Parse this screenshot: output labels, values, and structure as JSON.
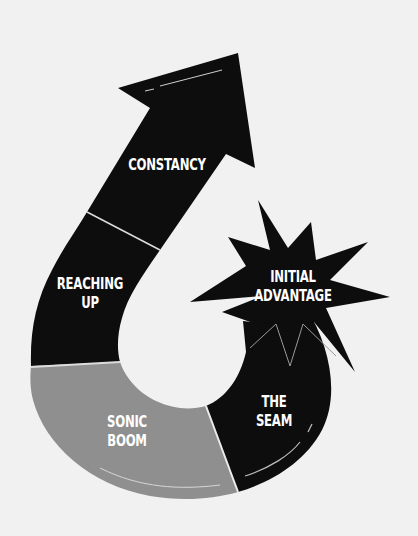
{
  "diagram": {
    "type": "curved-arrow-stages",
    "colors": {
      "background": "#f1f1f1",
      "dark_segment": "#0d0d0d",
      "highlight_segment": "#8f8f8f",
      "text": "#ffffff",
      "divider": "#dcdcdc"
    },
    "stages": [
      {
        "id": "the-seam",
        "line1": "THE",
        "line2": "SEAM"
      },
      {
        "id": "sonic-boom",
        "line1": "SONIC",
        "line2": "BOOM"
      },
      {
        "id": "reaching-up",
        "line1": "REACHING",
        "line2": "UP"
      },
      {
        "id": "constancy",
        "line1": "CONSTANCY",
        "line2": ""
      }
    ],
    "burst": {
      "line1": "INITIAL",
      "line2": "ADVANTAGE"
    }
  }
}
